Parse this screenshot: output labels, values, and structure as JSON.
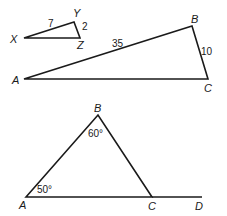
{
  "figure1": {
    "small_triangle": {
      "vertices": {
        "X": "X",
        "Y": "Y",
        "Z": "Z"
      },
      "sides": {
        "XY": "7",
        "YZ": "2"
      }
    },
    "large_triangle": {
      "vertices": {
        "A": "A",
        "B": "B",
        "C": "C"
      },
      "sides": {
        "AB": "35",
        "BC": "10"
      }
    }
  },
  "figure2": {
    "triangle": {
      "vertices": {
        "A": "A",
        "B": "B",
        "C": "C",
        "D": "D"
      },
      "angles": {
        "B": "60°",
        "A": "50°"
      }
    }
  },
  "colors": {
    "stroke": "#1a1a1a",
    "background": "#ffffff"
  }
}
